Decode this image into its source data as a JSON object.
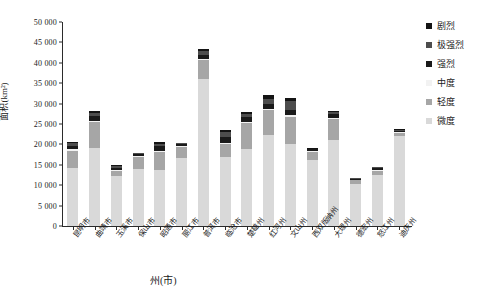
{
  "chart_data": {
    "type": "bar",
    "stacked": true,
    "title": "",
    "xlabel": "州(市)",
    "ylabel": "面积(km²)",
    "ylim": [
      0,
      50000
    ],
    "ytick_values": [
      0,
      5000,
      10000,
      15000,
      20000,
      25000,
      30000,
      35000,
      40000,
      45000,
      50000
    ],
    "ytick_labels": [
      "0",
      "5 000",
      "10 000",
      "15 000",
      "20 000",
      "25 000",
      "30 000",
      "35 000",
      "40 000",
      "45 000",
      "50 000"
    ],
    "grid": false,
    "legend_position": "right",
    "categories": [
      "昆明市",
      "曲靖市",
      "玉溪市",
      "保山市",
      "昭通市",
      "丽江市",
      "普洱市",
      "临沧市",
      "楚雄州",
      "红河州",
      "文山州",
      "西双版纳州",
      "大理州",
      "德宏州",
      "怒江州",
      "迪庆州"
    ],
    "series": [
      {
        "name": "微度",
        "color": "#d9d9d9",
        "values": [
          14300,
          19200,
          12200,
          13900,
          13800,
          16700,
          36100,
          17000,
          18800,
          22400,
          20200,
          16200,
          21000,
          10200,
          12600,
          22100
        ]
      },
      {
        "name": "轻度",
        "color": "#a6a6a6",
        "values": [
          4200,
          6200,
          1300,
          3100,
          4400,
          2700,
          4500,
          3100,
          6400,
          6000,
          6600,
          1900,
          5200,
          1000,
          900,
          700
        ]
      },
      {
        "name": "中度",
        "color": "#f2f2f2",
        "values": [
          300,
          300,
          200,
          200,
          300,
          300,
          400,
          300,
          300,
          300,
          300,
          200,
          300,
          200,
          200,
          200
        ]
      },
      {
        "name": "强烈",
        "color": "#1a1a1a",
        "values": [
          900,
          1200,
          500,
          500,
          1000,
          400,
          900,
          1400,
          1200,
          1300,
          1300,
          500,
          1000,
          200,
          500,
          400
        ]
      },
      {
        "name": "极强烈",
        "color": "#4d4d4d",
        "values": [
          600,
          700,
          500,
          200,
          700,
          200,
          900,
          1300,
          800,
          1100,
          2300,
          200,
          400,
          100,
          200,
          200
        ]
      },
      {
        "name": "剧烈",
        "color": "#141414",
        "values": [
          400,
          500,
          200,
          100,
          400,
          100,
          700,
          400,
          500,
          900,
          800,
          100,
          300,
          100,
          100,
          100
        ]
      }
    ],
    "legend_order": [
      "剧烈",
      "极强烈",
      "强烈",
      "中度",
      "轻度",
      "微度"
    ]
  },
  "legend": {
    "items": [
      {
        "label": "剧烈",
        "color": "#141414"
      },
      {
        "label": "极强烈",
        "color": "#4d4d4d"
      },
      {
        "label": "强烈",
        "color": "#1a1a1a"
      },
      {
        "label": "中度",
        "color": "#f2f2f2"
      },
      {
        "label": "轻度",
        "color": "#a6a6a6"
      },
      {
        "label": "微度",
        "color": "#d9d9d9"
      }
    ]
  }
}
